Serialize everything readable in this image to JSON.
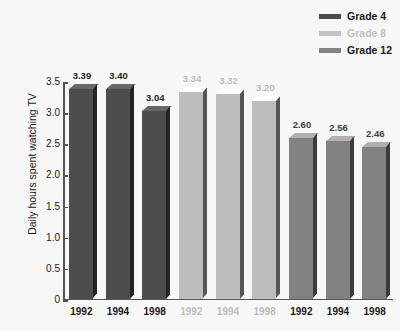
{
  "chart_data": {
    "type": "bar",
    "title": "",
    "xlabel": "",
    "ylabel": "Daily hours spent watching TV",
    "ylim": [
      0,
      3.5
    ],
    "grid": false,
    "legend_position": "top-right",
    "y_ticks": [
      "3.5",
      "3.0",
      "2.5",
      "2.0",
      "1.5",
      "1.0",
      "0.5",
      "0"
    ],
    "y_tick_values": [
      3.5,
      3.0,
      2.5,
      2.0,
      1.5,
      1.0,
      0.5,
      0
    ],
    "categories": [
      "1992",
      "1994",
      "1998"
    ],
    "series": [
      {
        "name": "Grade 4",
        "color": "#4d4d4d",
        "values": [
          3.39,
          3.4,
          3.04
        ],
        "labels": [
          "3.39",
          "3.40",
          "3.04"
        ]
      },
      {
        "name": "Grade 8",
        "color": "#bdbdbd",
        "values": [
          3.34,
          3.32,
          3.2
        ],
        "labels": [
          "3.34",
          "3.32",
          "3.20"
        ]
      },
      {
        "name": "Grade 12",
        "color": "#828282",
        "values": [
          2.6,
          2.56,
          2.46
        ],
        "labels": [
          "2.60",
          "2.56",
          "2.46"
        ]
      }
    ],
    "bars": [
      {
        "series": "Grade 4",
        "category": "1992",
        "value": 3.39,
        "label": "3.39",
        "color": "#4d4d4d",
        "label_color": "#262626"
      },
      {
        "series": "Grade 4",
        "category": "1994",
        "value": 3.4,
        "label": "3.40",
        "color": "#4d4d4d",
        "label_color": "#262626"
      },
      {
        "series": "Grade 4",
        "category": "1998",
        "value": 3.04,
        "label": "3.04",
        "color": "#4d4d4d",
        "label_color": "#262626"
      },
      {
        "series": "Grade 8",
        "category": "1992",
        "value": 3.34,
        "label": "3.34",
        "color": "#bdbdbd",
        "label_color": "#bdbdbd"
      },
      {
        "series": "Grade 8",
        "category": "1994",
        "value": 3.32,
        "label": "3.32",
        "color": "#bdbdbd",
        "label_color": "#bdbdbd"
      },
      {
        "series": "Grade 8",
        "category": "1998",
        "value": 3.2,
        "label": "3.20",
        "color": "#bdbdbd",
        "label_color": "#bdbdbd"
      },
      {
        "series": "Grade 12",
        "category": "1992",
        "value": 2.6,
        "label": "2.60",
        "color": "#828282",
        "label_color": "#3d3d3d"
      },
      {
        "series": "Grade 12",
        "category": "1994",
        "value": 2.56,
        "label": "2.56",
        "color": "#828282",
        "label_color": "#3d3d3d"
      },
      {
        "series": "Grade 12",
        "category": "1998",
        "value": 2.46,
        "label": "2.46",
        "color": "#828282",
        "label_color": "#3d3d3d"
      }
    ],
    "x_tick_labels": [
      {
        "text": "1992",
        "color": "#1a1a1a"
      },
      {
        "text": "1994",
        "color": "#1a1a1a"
      },
      {
        "text": "1998",
        "color": "#1a1a1a"
      },
      {
        "text": "1992",
        "color": "#bdbdbd"
      },
      {
        "text": "1994",
        "color": "#bdbdbd"
      },
      {
        "text": "1998",
        "color": "#bdbdbd"
      },
      {
        "text": "1992",
        "color": "#1a1a1a"
      },
      {
        "text": "1994",
        "color": "#1a1a1a"
      },
      {
        "text": "1998",
        "color": "#1a1a1a"
      }
    ]
  },
  "legend": {
    "items": [
      {
        "label": "Grade 4",
        "color": "#4d4d4d",
        "text_color": "#1a1a1a"
      },
      {
        "label": "Grade 8",
        "color": "#c4c4c4",
        "text_color": "#c0c0c0"
      },
      {
        "label": "Grade 12",
        "color": "#828282",
        "text_color": "#1a1a1a"
      }
    ]
  },
  "axis": {
    "y_title": "Daily hours spent watching TV"
  },
  "colors": {
    "background": "#f7f7f7",
    "axis": "#555555",
    "grade4": "#4d4d4d",
    "grade8": "#bdbdbd",
    "grade12": "#828282"
  }
}
